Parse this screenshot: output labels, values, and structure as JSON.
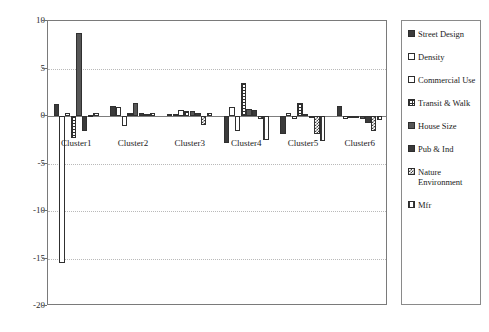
{
  "chart_data": {
    "type": "bar",
    "title": "",
    "xlabel": "",
    "ylabel": "",
    "ylim": [
      -20,
      10
    ],
    "yticks": [
      10,
      5,
      0,
      -5,
      -10,
      -15,
      -20
    ],
    "grid": true,
    "legend_position": "right",
    "categories": [
      "Cluster1",
      "Cluster2",
      "Cluster3",
      "Cluster4",
      "Cluster5",
      "Cluster6"
    ],
    "series": [
      {
        "name": "Street Design",
        "pattern": "solid-dark",
        "color": "#3b3b3b",
        "values": [
          1.3,
          1.1,
          0.25,
          -2.8,
          -1.9,
          1.1
        ]
      },
      {
        "name": "Density",
        "pattern": "white",
        "color": "#ffffff",
        "values": [
          -15.5,
          0.95,
          0.2,
          1.0,
          0.35,
          -0.35
        ]
      },
      {
        "name": "Commercial Use",
        "pattern": "white",
        "color": "#ffffff",
        "values": [
          0.35,
          -1.0,
          0.6,
          -1.6,
          -0.3,
          -0.2
        ]
      },
      {
        "name": "Transit & Walk",
        "pattern": "grid",
        "color": "#ffffff",
        "values": [
          -2.3,
          0.3,
          0.55,
          3.5,
          1.35,
          -0.25
        ]
      },
      {
        "name": "House Size",
        "pattern": "dots",
        "color": "#e8e8e8",
        "values": [
          8.7,
          1.4,
          0.5,
          0.75,
          0.2,
          -0.3
        ]
      },
      {
        "name": "Pub & Ind",
        "pattern": "dense",
        "color": "#cfcfcf",
        "values": [
          -1.6,
          0.3,
          0.3,
          0.65,
          -0.2,
          -0.7
        ]
      },
      {
        "name": "Nature Environment",
        "pattern": "check",
        "color": "#bdbdbd",
        "values": [
          0.15,
          0.25,
          -0.9,
          -0.35,
          -1.9,
          -1.6
        ]
      },
      {
        "name": "Mfr",
        "pattern": "vline",
        "color": "#ffffff",
        "values": [
          0.35,
          0.35,
          0.35,
          -2.5,
          -2.6,
          -0.45
        ]
      }
    ]
  },
  "legend": {
    "items": [
      {
        "label": "Street Design",
        "pattern": "solid-dark"
      },
      {
        "label": "Density",
        "pattern": "white"
      },
      {
        "label": "Commercial Use",
        "pattern": "white"
      },
      {
        "label": "Transit & Walk",
        "pattern": "grid"
      },
      {
        "label": "House Size",
        "pattern": "dots"
      },
      {
        "label": "Pub & Ind",
        "pattern": "dense"
      },
      {
        "label": "Nature Environment",
        "pattern": "check"
      },
      {
        "label": "Mfr",
        "pattern": "vline"
      }
    ]
  }
}
